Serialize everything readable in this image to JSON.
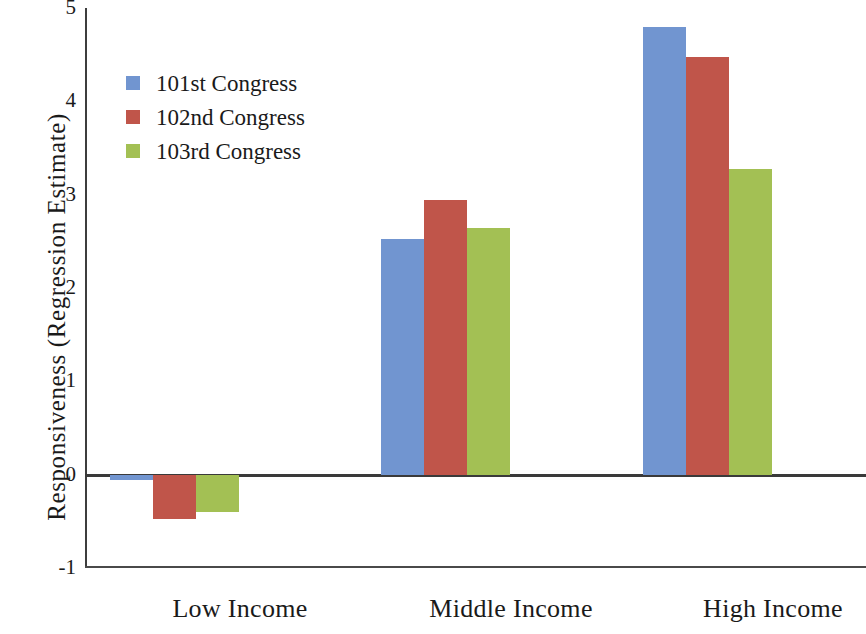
{
  "chart_data": {
    "type": "bar",
    "title": "",
    "subtitle": "",
    "xlabel": "",
    "ylabel": "Responsiveness (Regression Estimate)",
    "categories": [
      "Low Income",
      "Middle Income",
      "High Income"
    ],
    "series": [
      {
        "name": "101st Congress",
        "color": "#7195d0",
        "values": [
          -0.06,
          2.52,
          4.8
        ]
      },
      {
        "name": "102nd Congress",
        "color": "#c0554a",
        "values": [
          -0.48,
          2.94,
          4.48
        ]
      },
      {
        "name": "103rd Congress",
        "color": "#a3c054",
        "values": [
          -0.4,
          2.64,
          3.27
        ]
      }
    ],
    "ylim": [
      -1,
      5
    ],
    "yticks": [
      5,
      4,
      3,
      2,
      1,
      0,
      -1
    ],
    "ytick_labels": [
      "5",
      "4",
      "3",
      "2",
      "1",
      "0",
      "-1"
    ],
    "grid": false,
    "legend_position": "upper left",
    "zero_line": true,
    "bar_group_count": 3,
    "bars_per_group": 3
  },
  "legend": {
    "items": [
      {
        "label": "101st Congress",
        "color": "#7195d0"
      },
      {
        "label": "102nd Congress",
        "color": "#c0554a"
      },
      {
        "label": "103rd Congress",
        "color": "#a3c054"
      }
    ]
  },
  "axes": {
    "y_title": "Responsiveness (Regression Estimate)",
    "y_tick_labels": [
      "5",
      "4",
      "3",
      "2",
      "1",
      "0",
      "-1"
    ],
    "x_tick_labels": [
      "Low Income",
      "Middle Income",
      "High Income"
    ]
  }
}
